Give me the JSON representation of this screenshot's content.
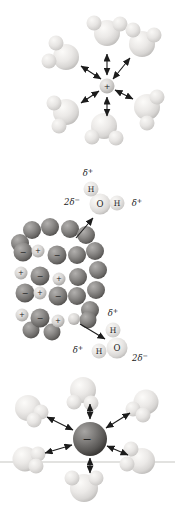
{
  "figure": {
    "width": 175,
    "height": 507
  },
  "colors": {
    "background": "#ffffff",
    "arrow": "#1c1c1c",
    "label": "#1b1b1b",
    "rule_line": "#d8d8d6",
    "gradients": {
      "water-oxygen": {
        "fx": "36%",
        "fy": "30%",
        "stops": [
          [
            "0%",
            "#fcfbf9"
          ],
          [
            "50%",
            "#ebe9e7"
          ],
          [
            "80%",
            "#d8d6d4"
          ],
          [
            "100%",
            "#bcbab8"
          ]
        ]
      },
      "water-hydrogen": {
        "fx": "35%",
        "fy": "30%",
        "stops": [
          [
            "0%",
            "#f9f8f6"
          ],
          [
            "55%",
            "#e7e5e3"
          ],
          [
            "100%",
            "#c9c7c5"
          ]
        ]
      },
      "lattice-anion": {
        "fx": "35%",
        "fy": "30%",
        "stops": [
          [
            "0%",
            "#b2b0ae"
          ],
          [
            "45%",
            "#8d8b89"
          ],
          [
            "80%",
            "#6b6967"
          ],
          [
            "100%",
            "#4e4c4a"
          ]
        ]
      },
      "lattice-cation": {
        "fx": "35%",
        "fy": "30%",
        "stops": [
          [
            "0%",
            "#f1efed"
          ],
          [
            "55%",
            "#d7d5d3"
          ],
          [
            "100%",
            "#a5a3a1"
          ]
        ]
      },
      "free-anion": {
        "fx": "34%",
        "fy": "28%",
        "stops": [
          [
            "0%",
            "#a7a5a3"
          ],
          [
            "45%",
            "#7b7977"
          ],
          [
            "78%",
            "#585654"
          ],
          [
            "100%",
            "#383634"
          ]
        ]
      },
      "free-cation": {
        "fx": "35%",
        "fy": "30%",
        "stops": [
          [
            "0%",
            "#f1efed"
          ],
          [
            "55%",
            "#d6d4d2"
          ],
          [
            "100%",
            "#aeacaa"
          ]
        ]
      }
    }
  },
  "rule_line": {
    "x1": 0,
    "y": 462,
    "x2": 175
  },
  "panels": {
    "cation_hydration": {
      "ion": {
        "symbol": "+",
        "x": 107,
        "y": 86,
        "r": 7.5,
        "kind": "cation"
      },
      "waters": [
        {
          "atoms": [
            {
              "el": "O",
              "x": 107,
              "y": 33,
              "r": 13
            },
            {
              "el": "H",
              "x": 94,
              "y": 23,
              "r": 7.5
            },
            {
              "el": "H",
              "x": 120,
              "y": 24,
              "r": 7.5
            }
          ],
          "charge_labels": []
        },
        {
          "atoms": [
            {
              "el": "O",
              "x": 66,
              "y": 57,
              "r": 13
            },
            {
              "el": "H",
              "x": 56,
              "y": 43,
              "r": 7.5
            },
            {
              "el": "H",
              "x": 49,
              "y": 61,
              "r": 7.5
            }
          ],
          "charge_labels": []
        },
        {
          "atoms": [
            {
              "el": "O",
              "x": 142,
              "y": 44,
              "r": 13
            },
            {
              "el": "H",
              "x": 133,
              "y": 30,
              "r": 7.5
            },
            {
              "el": "H",
              "x": 154,
              "y": 35,
              "r": 7.5
            }
          ],
          "charge_labels": []
        },
        {
          "atoms": [
            {
              "el": "O",
              "x": 66,
              "y": 112,
              "r": 13
            },
            {
              "el": "H",
              "x": 54,
              "y": 103,
              "r": 7.5
            },
            {
              "el": "H",
              "x": 59,
              "y": 126,
              "r": 7.5
            }
          ],
          "charge_labels": []
        },
        {
          "atoms": [
            {
              "el": "O",
              "x": 147,
              "y": 107,
              "r": 13
            },
            {
              "el": "H",
              "x": 157,
              "y": 97,
              "r": 7.5
            },
            {
              "el": "H",
              "x": 147,
              "y": 123,
              "r": 7.5
            }
          ],
          "charge_labels": []
        },
        {
          "atoms": [
            {
              "el": "O",
              "x": 104,
              "y": 126,
              "r": 13
            },
            {
              "el": "H",
              "x": 92,
              "y": 137,
              "r": 7.5
            },
            {
              "el": "H",
              "x": 116,
              "y": 138,
              "r": 7.5
            }
          ],
          "charge_labels": []
        }
      ],
      "arrows": [
        {
          "x1": 107,
          "y1": 75,
          "x2": 107,
          "y2": 54,
          "heads": 2
        },
        {
          "x1": 113,
          "y1": 79,
          "x2": 130,
          "y2": 58,
          "heads": 2
        },
        {
          "x1": 101,
          "y1": 79,
          "x2": 81,
          "y2": 66,
          "heads": 2
        },
        {
          "x1": 107,
          "y1": 97,
          "x2": 107,
          "y2": 116,
          "heads": 2
        },
        {
          "x1": 115,
          "y1": 90,
          "x2": 133,
          "y2": 99,
          "heads": 2
        },
        {
          "x1": 99,
          "y1": 91,
          "x2": 81,
          "y2": 103,
          "heads": 2
        }
      ]
    },
    "crystal_dissolution": {
      "lattice": [
        {
          "x": 32,
          "y": 230,
          "r": 9,
          "kind": "anion",
          "label": ""
        },
        {
          "x": 50,
          "y": 227,
          "r": 9,
          "kind": "anion",
          "label": ""
        },
        {
          "x": 70,
          "y": 229,
          "r": 9,
          "kind": "anion",
          "label": ""
        },
        {
          "x": 86,
          "y": 235,
          "r": 9,
          "kind": "anion",
          "label": ""
        },
        {
          "x": 20,
          "y": 243,
          "r": 9,
          "kind": "anion",
          "label": ""
        },
        {
          "x": 95,
          "y": 251,
          "r": 9,
          "kind": "anion",
          "label": ""
        },
        {
          "x": 98,
          "y": 270,
          "r": 9,
          "kind": "anion",
          "label": ""
        },
        {
          "x": 96,
          "y": 290,
          "r": 9,
          "kind": "anion",
          "label": ""
        },
        {
          "x": 90,
          "y": 310,
          "r": 9,
          "kind": "anion",
          "label": ""
        },
        {
          "x": 77,
          "y": 255,
          "r": 9,
          "kind": "anion",
          "label": ""
        },
        {
          "x": 78,
          "y": 277,
          "r": 9,
          "kind": "anion",
          "label": ""
        },
        {
          "x": 77,
          "y": 296,
          "r": 9,
          "kind": "anion",
          "label": ""
        },
        {
          "x": 88,
          "y": 320,
          "r": 8.5,
          "kind": "anion",
          "label": ""
        },
        {
          "x": 31,
          "y": 330,
          "r": 8.5,
          "kind": "anion",
          "label": ""
        },
        {
          "x": 52,
          "y": 332,
          "r": 8.5,
          "kind": "anion",
          "label": ""
        },
        {
          "x": 23,
          "y": 252,
          "r": 9.5,
          "kind": "anion",
          "label": "−"
        },
        {
          "x": 38,
          "y": 251,
          "r": 6.5,
          "kind": "cation",
          "label": "+"
        },
        {
          "x": 57,
          "y": 255,
          "r": 9.5,
          "kind": "anion",
          "label": "−"
        },
        {
          "x": 21,
          "y": 273,
          "r": 6.5,
          "kind": "cation",
          "label": "+"
        },
        {
          "x": 40,
          "y": 276,
          "r": 9.5,
          "kind": "anion",
          "label": "−"
        },
        {
          "x": 59,
          "y": 279,
          "r": 6.5,
          "kind": "cation",
          "label": "+"
        },
        {
          "x": 25,
          "y": 293,
          "r": 9.5,
          "kind": "anion",
          "label": "−"
        },
        {
          "x": 40,
          "y": 293,
          "r": 6.5,
          "kind": "cation",
          "label": "+"
        },
        {
          "x": 58,
          "y": 296,
          "r": 9.5,
          "kind": "anion",
          "label": "−"
        },
        {
          "x": 22,
          "y": 315,
          "r": 6.5,
          "kind": "cation",
          "label": "+"
        },
        {
          "x": 40,
          "y": 318,
          "r": 9.5,
          "kind": "anion",
          "label": "−"
        },
        {
          "x": 58,
          "y": 321,
          "r": 6.5,
          "kind": "cation",
          "label": "+"
        },
        {
          "x": 74,
          "y": 319,
          "r": 6,
          "kind": "cation",
          "label": ""
        }
      ],
      "waters": [
        {
          "atoms": [
            {
              "el": "O",
              "x": 100,
              "y": 204,
              "r": 10.5,
              "symbol": "O"
            },
            {
              "el": "H",
              "x": 91,
              "y": 189,
              "r": 7.5,
              "symbol": "H"
            },
            {
              "el": "H",
              "x": 117,
              "y": 203,
              "r": 7.5,
              "symbol": "H"
            }
          ],
          "charge_labels": [
            {
              "base": "δ",
              "sup": "+",
              "x": 88,
              "y": 176
            },
            {
              "base": "2δ",
              "sup": "−",
              "x": 72,
              "y": 205
            },
            {
              "base": "δ",
              "sup": "+",
              "x": 137,
              "y": 206
            }
          ]
        },
        {
          "atoms": [
            {
              "el": "O",
              "x": 117,
              "y": 348,
              "r": 10.5,
              "symbol": "O"
            },
            {
              "el": "H",
              "x": 113,
              "y": 330,
              "r": 7.5,
              "symbol": "H"
            },
            {
              "el": "H",
              "x": 99,
              "y": 351,
              "r": 7.5,
              "symbol": "H"
            }
          ],
          "charge_labels": [
            {
              "base": "δ",
              "sup": "+",
              "x": 113,
              "y": 316
            },
            {
              "base": "δ",
              "sup": "+",
              "x": 78,
              "y": 353
            },
            {
              "base": "2δ",
              "sup": "−",
              "x": 140,
              "y": 361
            }
          ]
        }
      ],
      "arrows": [
        {
          "x1": 76,
          "y1": 238,
          "x2": 93,
          "y2": 218,
          "heads": 1
        },
        {
          "x1": 80,
          "y1": 324,
          "x2": 105,
          "y2": 339,
          "heads": 1
        }
      ]
    },
    "anion_hydration": {
      "ion": {
        "symbol": "−",
        "x": 90,
        "y": 439,
        "r": 17,
        "kind": "anion"
      },
      "waters": [
        {
          "atoms": [
            {
              "el": "O",
              "x": 83,
              "y": 390,
              "r": 13
            },
            {
              "el": "H",
              "x": 74,
              "y": 402,
              "r": 7.5
            },
            {
              "el": "H",
              "x": 91,
              "y": 403,
              "r": 7.5
            }
          ],
          "charge_labels": []
        },
        {
          "atoms": [
            {
              "el": "O",
              "x": 28,
              "y": 408,
              "r": 13
            },
            {
              "el": "H",
              "x": 41,
              "y": 412,
              "r": 7.5
            },
            {
              "el": "H",
              "x": 34,
              "y": 420,
              "r": 7.5
            }
          ],
          "charge_labels": []
        },
        {
          "atoms": [
            {
              "el": "O",
              "x": 146,
              "y": 402,
              "r": 12.5
            },
            {
              "el": "H",
              "x": 133,
              "y": 409,
              "r": 7.5
            },
            {
              "el": "H",
              "x": 143,
              "y": 415,
              "r": 7.5
            }
          ],
          "charge_labels": []
        },
        {
          "atoms": [
            {
              "el": "O",
              "x": 25,
              "y": 459,
              "r": 12.5
            },
            {
              "el": "H",
              "x": 38,
              "y": 454,
              "r": 7.5
            },
            {
              "el": "H",
              "x": 36,
              "y": 466,
              "r": 7.5
            }
          ],
          "charge_labels": []
        },
        {
          "atoms": [
            {
              "el": "O",
              "x": 142,
              "y": 461,
              "r": 13
            },
            {
              "el": "H",
              "x": 131,
              "y": 449,
              "r": 7.5
            },
            {
              "el": "H",
              "x": 127,
              "y": 464,
              "r": 7.5
            }
          ],
          "charge_labels": []
        },
        {
          "atoms": [
            {
              "el": "O",
              "x": 84,
              "y": 488,
              "r": 14
            },
            {
              "el": "H",
              "x": 72,
              "y": 478,
              "r": 7.5
            },
            {
              "el": "H",
              "x": 96,
              "y": 478,
              "r": 7.5
            }
          ],
          "charge_labels": []
        }
      ],
      "arrows": [
        {
          "x1": 90,
          "y1": 419,
          "x2": 90,
          "y2": 404,
          "heads": 2
        },
        {
          "x1": 106,
          "y1": 428,
          "x2": 130,
          "y2": 413,
          "heads": 2
        },
        {
          "x1": 73,
          "y1": 430,
          "x2": 47,
          "y2": 417,
          "heads": 2
        },
        {
          "x1": 90,
          "y1": 458,
          "x2": 90,
          "y2": 473,
          "heads": 2
        },
        {
          "x1": 107,
          "y1": 446,
          "x2": 128,
          "y2": 455,
          "heads": 2
        },
        {
          "x1": 72,
          "y1": 445,
          "x2": 45,
          "y2": 453,
          "heads": 2
        }
      ]
    }
  }
}
